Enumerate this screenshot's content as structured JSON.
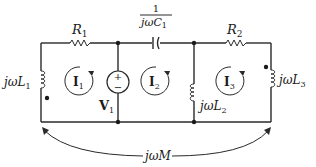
{
  "diagram": {
    "type": "circuit",
    "title": "",
    "components": {
      "R1": {
        "label": "R",
        "sub": "1"
      },
      "R2": {
        "label": "R",
        "sub": "2"
      },
      "C1": {
        "numerator": "1",
        "denominator_prefix": "jω",
        "denominator_var": "C",
        "sub": "1"
      },
      "L1": {
        "prefix": "jω",
        "var": "L",
        "sub": "1"
      },
      "L2": {
        "prefix": "jω",
        "var": "L",
        "sub": "2"
      },
      "L3": {
        "prefix": "jω",
        "var": "L",
        "sub": "3"
      },
      "V1": {
        "label": "V",
        "sub": "1",
        "plus": "+",
        "minus": "−"
      },
      "M": {
        "prefix": "jω",
        "var": "M"
      }
    },
    "mesh_currents": [
      {
        "label": "I",
        "sub": "1",
        "direction": "clockwise"
      },
      {
        "label": "I",
        "sub": "2",
        "direction": "clockwise"
      },
      {
        "label": "I",
        "sub": "3",
        "direction": "clockwise"
      }
    ],
    "dot_convention": [
      "L1 bottom terminal",
      "L3 top terminal"
    ],
    "nodes": 4
  }
}
